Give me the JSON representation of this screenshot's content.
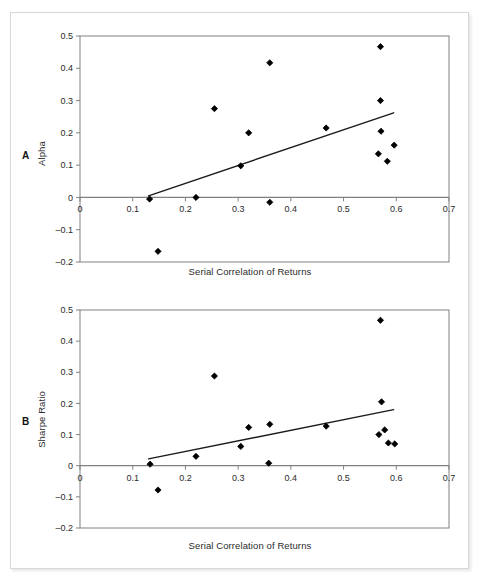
{
  "figure": {
    "background": "#ffffff",
    "border_color": "#d8d8d8",
    "marker_color": "#000000",
    "line_color": "#1a1a1a",
    "axis_color": "#808080"
  },
  "panels": [
    {
      "letter": "A",
      "ylabel": "Alpha",
      "xlabel": "Serial Correlation of Returns"
    },
    {
      "letter": "B",
      "ylabel": "Sharpe Ratio",
      "xlabel": "Serial Correlation of Returns"
    }
  ],
  "chart_data": [
    {
      "type": "scatter",
      "panel": "A",
      "title": "",
      "xlabel": "Serial Correlation of Returns",
      "ylabel": "Alpha",
      "xlim": [
        0,
        0.7
      ],
      "ylim": [
        -0.2,
        0.5
      ],
      "xticks": [
        0,
        0.1,
        0.2,
        0.3,
        0.4,
        0.5,
        0.6,
        0.7
      ],
      "xticklabels": [
        "0",
        "0.1",
        "0.2",
        "0.3",
        "0.4",
        "0.5",
        "0.6",
        "0.7"
      ],
      "yticks": [
        -0.2,
        -0.1,
        0,
        0.1,
        0.2,
        0.3,
        0.4,
        0.5
      ],
      "yticklabels": [
        "-0.2",
        "-0.1",
        "0",
        "0.1",
        "0.2",
        "0.3",
        "0.4",
        "0.5"
      ],
      "grid": false,
      "legend": null,
      "marker": "diamond",
      "points": [
        {
          "x": 0.132,
          "y": -0.005
        },
        {
          "x": 0.148,
          "y": -0.167
        },
        {
          "x": 0.22,
          "y": 0.0
        },
        {
          "x": 0.255,
          "y": 0.275
        },
        {
          "x": 0.305,
          "y": 0.098
        },
        {
          "x": 0.32,
          "y": 0.2
        },
        {
          "x": 0.36,
          "y": 0.417
        },
        {
          "x": 0.36,
          "y": -0.015
        },
        {
          "x": 0.467,
          "y": 0.215
        },
        {
          "x": 0.566,
          "y": 0.135
        },
        {
          "x": 0.57,
          "y": 0.467
        },
        {
          "x": 0.57,
          "y": 0.3
        },
        {
          "x": 0.571,
          "y": 0.205
        },
        {
          "x": 0.583,
          "y": 0.112
        },
        {
          "x": 0.596,
          "y": 0.162
        }
      ],
      "trendline": {
        "x0": 0.13,
        "y0": 0.005,
        "x1": 0.595,
        "y1": 0.262
      }
    },
    {
      "type": "scatter",
      "panel": "B",
      "title": "",
      "xlabel": "Serial Correlation of Returns",
      "ylabel": "Sharpe Ratio",
      "xlim": [
        0,
        0.7
      ],
      "ylim": [
        -0.2,
        0.5
      ],
      "xticks": [
        0,
        0.1,
        0.2,
        0.3,
        0.4,
        0.5,
        0.6,
        0.7
      ],
      "xticklabels": [
        "0",
        "0.1",
        "0.2",
        "0.3",
        "0.4",
        "0.5",
        "0.6",
        "0.7"
      ],
      "yticks": [
        -0.2,
        -0.1,
        0,
        0.1,
        0.2,
        0.3,
        0.4,
        0.5
      ],
      "yticklabels": [
        "-0.2",
        "-0.1",
        "0",
        "0.1",
        "0.2",
        "0.3",
        "0.4",
        "0.5"
      ],
      "grid": false,
      "legend": null,
      "marker": "diamond",
      "points": [
        {
          "x": 0.133,
          "y": 0.005
        },
        {
          "x": 0.148,
          "y": -0.078
        },
        {
          "x": 0.22,
          "y": 0.03
        },
        {
          "x": 0.255,
          "y": 0.288
        },
        {
          "x": 0.305,
          "y": 0.062
        },
        {
          "x": 0.32,
          "y": 0.123
        },
        {
          "x": 0.358,
          "y": 0.008
        },
        {
          "x": 0.36,
          "y": 0.133
        },
        {
          "x": 0.467,
          "y": 0.127
        },
        {
          "x": 0.567,
          "y": 0.1
        },
        {
          "x": 0.57,
          "y": 0.467
        },
        {
          "x": 0.572,
          "y": 0.205
        },
        {
          "x": 0.578,
          "y": 0.115
        },
        {
          "x": 0.585,
          "y": 0.073
        },
        {
          "x": 0.597,
          "y": 0.07
        }
      ],
      "trendline": {
        "x0": 0.13,
        "y0": 0.022,
        "x1": 0.595,
        "y1": 0.18
      }
    }
  ]
}
